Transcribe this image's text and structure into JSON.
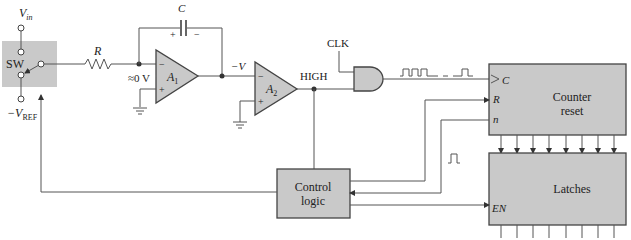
{
  "figure": {
    "type": "dual-slope ADC block diagram",
    "colors": {
      "block_fill": "#c9c9c9",
      "wire": "#555555",
      "background": "#ffffff"
    }
  },
  "labels": {
    "vin": "V",
    "vin_sub": "in",
    "vref": "−V",
    "vref_sub": "REF",
    "switch": "SW",
    "resistor": "R",
    "capacitor": "C",
    "cap_plus": "+",
    "cap_minus": "−",
    "virtual_ground": "≈0 V",
    "a1": "A",
    "a1_sub": "1",
    "a2": "A",
    "a2_sub": "2",
    "neg_v": "−V",
    "high": "HIGH",
    "clk": "CLK",
    "opamp_minus": "−",
    "opamp_plus": "+",
    "counter_c": "C",
    "counter_r": "R",
    "counter_n": "n",
    "counter_line1": "Counter",
    "counter_line2": "reset",
    "latches": "Latches",
    "latches_en": "EN",
    "control_line1": "Control",
    "control_line2": "logic"
  }
}
